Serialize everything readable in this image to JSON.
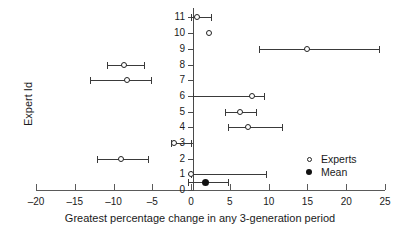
{
  "chart_data": {
    "type": "scatter",
    "title": "",
    "xlabel": "Greatest percentage change in any 3-generation period",
    "ylabel": "Expert Id",
    "xlim": [
      -20,
      25
    ],
    "ylim": [
      0,
      11.6
    ],
    "xticks": [
      -20,
      -15,
      -10,
      -5,
      0,
      5,
      10,
      15,
      20,
      25
    ],
    "xticklabels": [
      "–20",
      "–15",
      "–10",
      "–5",
      "0",
      "5",
      "10",
      "15",
      "20",
      "25"
    ],
    "yticks": [
      0,
      1,
      2,
      3,
      4,
      5,
      6,
      7,
      8,
      9,
      10,
      11
    ],
    "yticklabels": [
      "0",
      "1",
      "2",
      "3",
      "4",
      "5",
      "6",
      "7",
      "8",
      "9",
      "10",
      "11"
    ],
    "grid": false,
    "orientation": "horizontal-error-bars",
    "legend_position": "inside-lower-right",
    "legend": [
      {
        "label": "Experts",
        "marker": "open-circle"
      },
      {
        "label": "Mean",
        "marker": "filled-circle"
      }
    ],
    "series": [
      {
        "name": "Experts",
        "marker": "open-circle",
        "points": [
          {
            "y": 11,
            "x": 0.8,
            "low": 0.0,
            "high": 2.6,
            "has_error_bar": true
          },
          {
            "y": 10,
            "x": 2.3,
            "low": null,
            "high": null,
            "has_error_bar": false
          },
          {
            "y": 9,
            "x": 15.0,
            "low": 8.8,
            "high": 24.2,
            "has_error_bar": true
          },
          {
            "y": 8,
            "x": -8.6,
            "low": -10.8,
            "high": -6.1,
            "has_error_bar": true
          },
          {
            "y": 7,
            "x": -8.3,
            "low": -13.0,
            "high": -5.2,
            "has_error_bar": true
          },
          {
            "y": 6,
            "x": 7.8,
            "low": 0.2,
            "high": 9.4,
            "has_error_bar": true
          },
          {
            "y": 5,
            "x": 6.3,
            "low": 4.4,
            "high": 8.4,
            "has_error_bar": true
          },
          {
            "y": 4,
            "x": 7.3,
            "low": 4.8,
            "high": 11.7,
            "has_error_bar": true
          },
          {
            "y": 3,
            "x": -2.2,
            "low": -2.6,
            "high": 0.0,
            "has_error_bar": true
          },
          {
            "y": 2,
            "x": -9.0,
            "low": -12.1,
            "high": -5.6,
            "has_error_bar": true
          },
          {
            "y": 1,
            "x": 0.0,
            "low": 0.0,
            "high": 9.6,
            "has_error_bar": true
          }
        ]
      },
      {
        "name": "Mean",
        "marker": "filled-circle",
        "points": [
          {
            "y": 0.5,
            "x": 1.8,
            "low": -0.4,
            "high": 4.7,
            "has_error_bar": true
          }
        ]
      }
    ]
  }
}
